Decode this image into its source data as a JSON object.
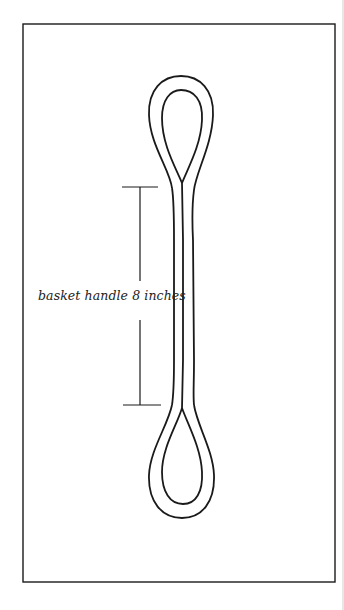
{
  "diagram": {
    "subject": "basket handle",
    "label": "basket handle 8 inches",
    "colors": {
      "background": "#ffffff",
      "ink": "#1a1a1a"
    }
  }
}
